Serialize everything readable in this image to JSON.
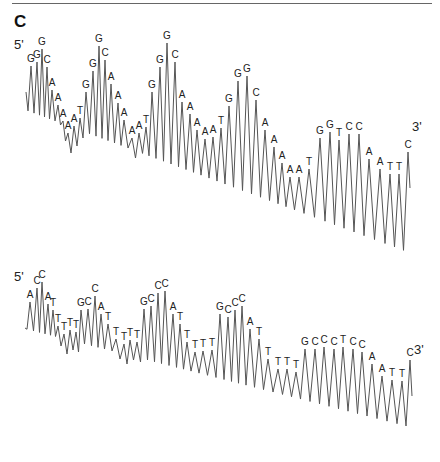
{
  "figure": {
    "panel_label": "C",
    "line_color": "#555555",
    "background": "#ffffff"
  },
  "chart_data": [
    {
      "type": "line",
      "title": "DNA sequencing chromatogram (top trace)",
      "start_label": "5'",
      "end_label": "3'",
      "sequence": "GGGCAAAAATGGGCAAAATGGGCAAAAATGGGCAAATGGTCCAATTC",
      "peaks": [
        {
          "b": "G",
          "x": 31,
          "y": 62
        },
        {
          "b": "G",
          "x": 37,
          "y": 58
        },
        {
          "b": "G",
          "x": 42,
          "y": 45
        },
        {
          "b": "C",
          "x": 47,
          "y": 63
        },
        {
          "b": "A",
          "x": 52,
          "y": 86
        },
        {
          "b": "A",
          "x": 58,
          "y": 101
        },
        {
          "b": "A",
          "x": 63,
          "y": 117
        },
        {
          "b": "A",
          "x": 68,
          "y": 129
        },
        {
          "b": "A",
          "x": 74,
          "y": 122
        },
        {
          "b": "T",
          "x": 80,
          "y": 114
        },
        {
          "b": "G",
          "x": 86,
          "y": 88
        },
        {
          "b": "G",
          "x": 93,
          "y": 67
        },
        {
          "b": "G",
          "x": 99,
          "y": 42
        },
        {
          "b": "C",
          "x": 105,
          "y": 56
        },
        {
          "b": "A",
          "x": 111,
          "y": 80
        },
        {
          "b": "A",
          "x": 118,
          "y": 99
        },
        {
          "b": "A",
          "x": 124,
          "y": 116
        },
        {
          "b": "A",
          "x": 132,
          "y": 134
        },
        {
          "b": "A",
          "x": 139,
          "y": 129
        },
        {
          "b": "T",
          "x": 146,
          "y": 123
        },
        {
          "b": "G",
          "x": 152,
          "y": 88
        },
        {
          "b": "G",
          "x": 160,
          "y": 63
        },
        {
          "b": "G",
          "x": 167,
          "y": 39
        },
        {
          "b": "C",
          "x": 175,
          "y": 58
        },
        {
          "b": "A",
          "x": 182,
          "y": 98
        },
        {
          "b": "A",
          "x": 190,
          "y": 110
        },
        {
          "b": "A",
          "x": 197,
          "y": 126
        },
        {
          "b": "A",
          "x": 205,
          "y": 135
        },
        {
          "b": "A",
          "x": 213,
          "y": 133
        },
        {
          "b": "T",
          "x": 221,
          "y": 124
        },
        {
          "b": "G",
          "x": 229,
          "y": 102
        },
        {
          "b": "G",
          "x": 238,
          "y": 77
        },
        {
          "b": "G",
          "x": 247,
          "y": 72
        },
        {
          "b": "C",
          "x": 256,
          "y": 96
        },
        {
          "b": "A",
          "x": 265,
          "y": 126
        },
        {
          "b": "A",
          "x": 274,
          "y": 143
        },
        {
          "b": "A",
          "x": 282,
          "y": 159
        },
        {
          "b": "A",
          "x": 290,
          "y": 173
        },
        {
          "b": "A",
          "x": 299,
          "y": 173
        },
        {
          "b": "T",
          "x": 309,
          "y": 165
        },
        {
          "b": "G",
          "x": 320,
          "y": 134
        },
        {
          "b": "G",
          "x": 330,
          "y": 128
        },
        {
          "b": "T",
          "x": 339,
          "y": 136
        },
        {
          "b": "C",
          "x": 349,
          "y": 130
        },
        {
          "b": "C",
          "x": 359,
          "y": 130
        },
        {
          "b": "A",
          "x": 369,
          "y": 155
        },
        {
          "b": "A",
          "x": 380,
          "y": 165
        },
        {
          "b": "T",
          "x": 390,
          "y": 170
        },
        {
          "b": "T",
          "x": 399,
          "y": 170
        },
        {
          "b": "C",
          "x": 408,
          "y": 148
        }
      ],
      "baseline": {
        "start_y": 100,
        "end_y": 240
      }
    },
    {
      "type": "line",
      "title": "DNA sequencing chromatogram (bottom trace)",
      "start_label": "5'",
      "end_label": "3'",
      "sequence": "ACCATTTTTGCCCATTTTTGCCCATTTTGCCCTCCAATTC",
      "peaks": [
        {
          "b": "A",
          "x": 30,
          "y": 298
        },
        {
          "b": "C",
          "x": 37,
          "y": 284
        },
        {
          "b": "C",
          "x": 42,
          "y": 278
        },
        {
          "b": "A",
          "x": 48,
          "y": 300
        },
        {
          "b": "T",
          "x": 53,
          "y": 306
        },
        {
          "b": "T",
          "x": 58,
          "y": 322
        },
        {
          "b": "T",
          "x": 64,
          "y": 330
        },
        {
          "b": "T",
          "x": 70,
          "y": 326
        },
        {
          "b": "T",
          "x": 76,
          "y": 328
        },
        {
          "b": "G",
          "x": 81,
          "y": 306
        },
        {
          "b": "C",
          "x": 88,
          "y": 305
        },
        {
          "b": "C",
          "x": 95,
          "y": 292
        },
        {
          "b": "A",
          "x": 101,
          "y": 310
        },
        {
          "b": "T",
          "x": 108,
          "y": 320
        },
        {
          "b": "T",
          "x": 116,
          "y": 335
        },
        {
          "b": "T",
          "x": 124,
          "y": 340
        },
        {
          "b": "T",
          "x": 130,
          "y": 336
        },
        {
          "b": "T",
          "x": 137,
          "y": 338
        },
        {
          "b": "G",
          "x": 144,
          "y": 305
        },
        {
          "b": "C",
          "x": 151,
          "y": 302
        },
        {
          "b": "C",
          "x": 158,
          "y": 289
        },
        {
          "b": "C",
          "x": 165,
          "y": 287
        },
        {
          "b": "A",
          "x": 173,
          "y": 310
        },
        {
          "b": "T",
          "x": 180,
          "y": 320
        },
        {
          "b": "T",
          "x": 187,
          "y": 338
        },
        {
          "b": "T",
          "x": 195,
          "y": 348
        },
        {
          "b": "T",
          "x": 203,
          "y": 347
        },
        {
          "b": "T",
          "x": 212,
          "y": 346
        },
        {
          "b": "G",
          "x": 220,
          "y": 310
        },
        {
          "b": "C",
          "x": 228,
          "y": 313
        },
        {
          "b": "C",
          "x": 235,
          "y": 306
        },
        {
          "b": "C",
          "x": 242,
          "y": 302
        },
        {
          "b": "A",
          "x": 250,
          "y": 325
        },
        {
          "b": "T",
          "x": 259,
          "y": 335
        },
        {
          "b": "T",
          "x": 268,
          "y": 355
        },
        {
          "b": "T",
          "x": 278,
          "y": 365
        },
        {
          "b": "T",
          "x": 287,
          "y": 365
        },
        {
          "b": "T",
          "x": 296,
          "y": 368
        },
        {
          "b": "G",
          "x": 305,
          "y": 345
        },
        {
          "b": "C",
          "x": 315,
          "y": 345
        },
        {
          "b": "C",
          "x": 324,
          "y": 343
        },
        {
          "b": "C",
          "x": 334,
          "y": 345
        },
        {
          "b": "T",
          "x": 343,
          "y": 343
        },
        {
          "b": "C",
          "x": 353,
          "y": 345
        },
        {
          "b": "C",
          "x": 362,
          "y": 348
        },
        {
          "b": "A",
          "x": 372,
          "y": 360
        },
        {
          "b": "A",
          "x": 382,
          "y": 372
        },
        {
          "b": "T",
          "x": 392,
          "y": 376
        },
        {
          "b": "T",
          "x": 402,
          "y": 377
        },
        {
          "b": "C",
          "x": 410,
          "y": 356
        }
      ],
      "baseline": {
        "start_y": 318,
        "end_y": 415
      }
    }
  ]
}
